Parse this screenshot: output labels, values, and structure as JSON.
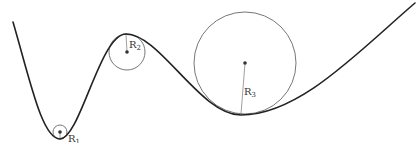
{
  "diagram": {
    "colors": {
      "curve": "#222222",
      "circle": "#777777",
      "radius": "#888888",
      "center": "#333333",
      "label": "#333333"
    },
    "curve_path": "M13,22 C30,80 42,139 60,139 C80,139 100,34 126,34 C160,34 200,115 241,115 C300,115 360,50 415,3",
    "circles": [
      {
        "id": "R1",
        "label": "R",
        "subscript": "1",
        "cx": 60,
        "cy": 132,
        "r": 7,
        "tangent_x": 60,
        "tangent_y": 139,
        "label_x": 68,
        "label_y": 142
      },
      {
        "id": "R2",
        "label": "R",
        "subscript": "2",
        "cx": 127,
        "cy": 52,
        "r": 18,
        "tangent_x": 126,
        "tangent_y": 34,
        "label_x": 129,
        "label_y": 48
      },
      {
        "id": "R3",
        "label": "R",
        "subscript": "3",
        "cx": 245,
        "cy": 63,
        "r": 51,
        "tangent_x": 241,
        "tangent_y": 114,
        "label_x": 244,
        "label_y": 95
      }
    ]
  }
}
